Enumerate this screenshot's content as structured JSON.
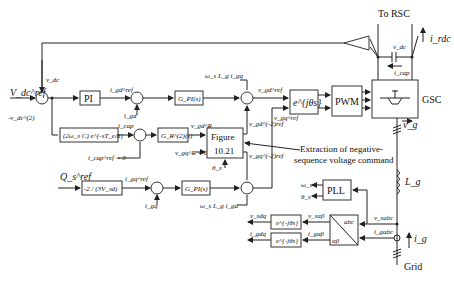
{
  "diagram": {
    "type": "control-block-diagram",
    "top_label": "To RSC",
    "blocks": {
      "pi": "PI",
      "g_pi_d": "G_PI(s)",
      "g_pi_q": "G_PI(s)",
      "cap_ff": "(2ω_s C) e^{-sT_e/8}",
      "g_r2": "G_R^(2)(s)",
      "figure_line1": "Figure",
      "figure_line2": "10.21",
      "q_gain": "-2 / (3V_sd)",
      "rotate_fwd": "e^{jθs}",
      "pwm": "PWM",
      "gsc": "GSC",
      "pll": "PLL",
      "abc_top": "abc",
      "abc_bottom": "αβ",
      "rotate_inv_v": "e^{-jθs}",
      "rotate_inv_i": "e^{-jθs}"
    },
    "signals": {
      "vdc_ref": "V_dc^ref",
      "vdc": "v_dc",
      "vdc2": "-v_dc^(2)",
      "igd_ref": "i_gd^ref",
      "igd": "i_gd",
      "icap": "i_cap",
      "icap_ref": "i_cap^ref = 0",
      "vgd_R": "v_gd^R",
      "vgq_R": "v_gq^R = 0",
      "theta_s": "θ_s",
      "qs_ref": "Q_s^ref",
      "igq_ref": "i_gq^ref",
      "igq": "i_gq",
      "ff_d": "ω_s L_g i_gq",
      "ff_q": "ω_s L_g i_gd",
      "vgd_neg": "v_gd^(-2)ref",
      "vgq_neg": "v_gq^(-2)ref",
      "vgd_ref": "v_gd^ref",
      "vgq_ref": "v_gq^ref",
      "irdc": "i_rdc",
      "vdc_cap": "v_dc",
      "icap_dc": "i_cap",
      "vg": "v_g",
      "lg": "L_g",
      "omega_s": "ω_s",
      "theta_s_pll": "θ_s",
      "vsdq": "v_sdq",
      "vsab": "v_sαβ",
      "vsabc": "v_sabc",
      "igdq": "i_gdq",
      "igab": "i_gαβ",
      "igabc": "i_gabc",
      "ig": "i_g",
      "grid": "Grid"
    },
    "annotation": {
      "line1": "Extraction of negative-",
      "line2": "sequence voltage command"
    }
  }
}
